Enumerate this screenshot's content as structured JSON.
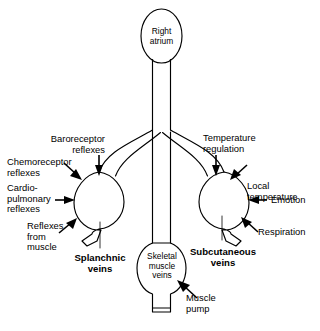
{
  "diagram": {
    "stroke_color": "#000000",
    "background_color": "#ffffff",
    "nodes": {
      "right_atrium": "Right\natrium",
      "splanchnic_veins": "Splanchnic\nveins",
      "subcutaneous_veins": "Subcutaneous\nveins",
      "skeletal_muscle_veins": "Skeletal\nmuscle\nveins"
    },
    "left_inputs": [
      {
        "label": "Baroreceptor\nreflexes",
        "target": "splanchnic_veins"
      },
      {
        "label": "Chemoreceptor\nreflexes",
        "target": "splanchnic_veins"
      },
      {
        "label": "Cardio-\npulmonary\nreflexes",
        "target": "splanchnic_veins"
      },
      {
        "label": "Reflexes\nfrom\nmuscle",
        "target": "splanchnic_veins"
      }
    ],
    "right_inputs": [
      {
        "label": "Temperature\nregulation",
        "target": "subcutaneous_veins"
      },
      {
        "label": "Local\ntemperature",
        "target": "subcutaneous_veins"
      },
      {
        "label": "Emotion",
        "target": "subcutaneous_veins"
      },
      {
        "label": "Respiration",
        "target": "subcutaneous_veins"
      }
    ],
    "center_inputs": [
      {
        "label": "Muscle\npump",
        "target": "skeletal_muscle_veins"
      }
    ]
  }
}
